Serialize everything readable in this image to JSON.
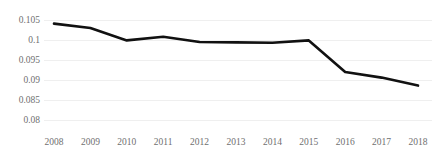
{
  "chart_data": {
    "type": "line",
    "title": "",
    "xlabel": "",
    "ylabel": "",
    "categories": [
      "2008",
      "2009",
      "2010",
      "2011",
      "2012",
      "2013",
      "2014",
      "2015",
      "2016",
      "2017",
      "2018"
    ],
    "values": [
      0.1041,
      0.103,
      0.0999,
      0.1008,
      0.0995,
      0.0994,
      0.0993,
      0.0999,
      0.092,
      0.0906,
      0.0886
    ],
    "series": [
      {
        "name": "series-1",
        "values": [
          0.1041,
          0.103,
          0.0999,
          0.1008,
          0.0995,
          0.0994,
          0.0993,
          0.0999,
          0.092,
          0.0906,
          0.0886
        ]
      }
    ],
    "ylim": [
      0.08,
      0.105
    ],
    "ytick_labels": [
      "0.105",
      "0.1",
      "0.095",
      "0.09",
      "0.085",
      "0.08"
    ],
    "ytick_values": [
      0.105,
      0.1,
      0.095,
      0.09,
      0.085,
      0.08
    ],
    "xtick_labels": [
      "2008",
      "2009",
      "2010",
      "2011",
      "2012",
      "2013",
      "2014",
      "2015",
      "2016",
      "2017",
      "2018"
    ],
    "grid": true,
    "grid_axis": "y",
    "legend": false,
    "legend_position": "none",
    "line_color": "#111111",
    "line_width": 2.6,
    "grid_color": "#efefef",
    "tick_label_color": "#6f6f6f",
    "background_color": "#ffffff",
    "markers": false
  }
}
